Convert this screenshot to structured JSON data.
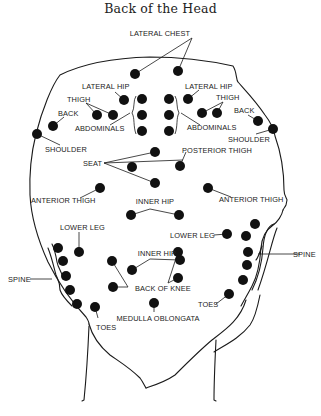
{
  "title": "Back of the Head",
  "colors": {
    "dot": "#111111",
    "line": "#1a1a1a",
    "background": "#ffffff"
  },
  "labels": {
    "lateral_chest": "LATERAL CHEST",
    "lateral_hip_left": "LATERAL HIP",
    "lateral_hip_right": "LATERAL HIP",
    "thigh_left": "THIGH",
    "thigh_right": "THIGH",
    "back_left": "BACK",
    "back_right": "BACK",
    "shoulder_left": "SHOULDER",
    "shoulder_right": "SHOULDER",
    "abdominals_left": "ABDOMINALS",
    "abdominals_right": "ABDOMINALS",
    "seat": "SEAT",
    "posterior_thigh": "POSTERIOR THIGH",
    "anterior_thigh_left": "ANTERIOR THIGH",
    "anterior_thigh_right": "ANTERIOR THIGH",
    "inner_hip_upper": "INNER HIP",
    "lower_leg_left": "LOWER LEG",
    "lower_leg_right": "LOWER LEG",
    "spine_left": "SPINE",
    "spine_right": "SPINE",
    "inner_hip_lower": "INNER HIP",
    "back_of_knee": "BACK OF KNEE",
    "toes_left": "TOES",
    "toes_right": "TOES",
    "medulla_oblongata": "MEDULLA OBLONGATA"
  },
  "points": [
    {
      "name": "lateral-chest",
      "coords": [
        [
          135,
          74
        ],
        [
          178,
          71
        ]
      ]
    },
    {
      "name": "lateral-hip",
      "coords": [
        [
          124,
          100
        ],
        [
          188,
          99
        ]
      ]
    },
    {
      "name": "thigh",
      "coords": [
        [
          97,
          115
        ],
        [
          113,
          115
        ],
        [
          202,
          113
        ],
        [
          217,
          113
        ]
      ]
    },
    {
      "name": "back",
      "coords": [
        [
          53,
          126
        ],
        [
          258,
          121
        ]
      ]
    },
    {
      "name": "shoulder",
      "coords": [
        [
          37,
          134
        ],
        [
          273,
          129
        ]
      ]
    },
    {
      "name": "abdominals",
      "coords": [
        [
          142,
          99
        ],
        [
          142,
          115
        ],
        [
          142,
          131
        ],
        [
          169,
          99
        ],
        [
          169,
          115
        ],
        [
          169,
          131
        ]
      ]
    },
    {
      "name": "seat",
      "coords": [
        [
          155,
          152
        ],
        [
          132,
          167
        ],
        [
          155,
          183
        ]
      ]
    },
    {
      "name": "posterior-thigh",
      "coords": [
        [
          180,
          166
        ]
      ]
    },
    {
      "name": "anterior-thigh",
      "coords": [
        [
          100,
          188
        ],
        [
          208,
          188
        ]
      ]
    },
    {
      "name": "inner-hip-upper",
      "coords": [
        [
          131,
          215
        ],
        [
          179,
          215
        ]
      ]
    },
    {
      "name": "lower-leg",
      "coords": [
        [
          79,
          252
        ],
        [
          227,
          234
        ]
      ]
    },
    {
      "name": "spine",
      "coords": [
        [
          58,
          248
        ],
        [
          63,
          261
        ],
        [
          66,
          276
        ],
        [
          70,
          290
        ],
        [
          77,
          304
        ],
        [
          255,
          224
        ],
        [
          246,
          236
        ],
        [
          248,
          252
        ],
        [
          247,
          265
        ],
        [
          243,
          280
        ]
      ]
    },
    {
      "name": "inner-hip-lower",
      "coords": [
        [
          132,
          270
        ],
        [
          180,
          260
        ]
      ]
    },
    {
      "name": "back-of-knee",
      "coords": [
        [
          112,
          261
        ],
        [
          113,
          287
        ],
        [
          178,
          278
        ]
      ]
    },
    {
      "name": "toes",
      "coords": [
        [
          95,
          307
        ],
        [
          229,
          294
        ]
      ]
    },
    {
      "name": "medulla-oblongata",
      "coords": [
        [
          154,
          303
        ]
      ]
    }
  ]
}
